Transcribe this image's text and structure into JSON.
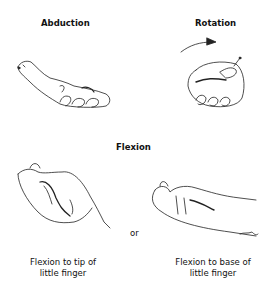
{
  "figure": {
    "panels": [
      {
        "id": "abduction",
        "title": "Abduction"
      },
      {
        "id": "rotation",
        "title": "Rotation"
      }
    ],
    "section_title": "Flexion",
    "flexion_variants": [
      {
        "caption_line1": "Flexion to tip of",
        "caption_line2": "little finger"
      },
      {
        "caption_line1": "Flexion to base of",
        "caption_line2": "little finger"
      }
    ],
    "connector": "or",
    "signature": "Sym"
  }
}
